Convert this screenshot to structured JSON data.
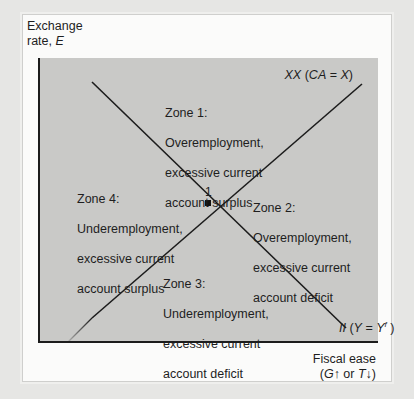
{
  "axes": {
    "y_label_line1": "Exchange",
    "y_label_line2_prefix": "rate, ",
    "y_label_var": "E",
    "x_label_line1": "Fiscal ease",
    "x_label_line2_open": "(",
    "x_label_G": "G",
    "x_label_up": "↑ or ",
    "x_label_T": "T",
    "x_label_down": "↓)"
  },
  "curves": {
    "xx": {
      "name": "XX",
      "condition_open": " (",
      "condition_var": "CA",
      "condition_eq": " = ",
      "condition_rhs": "X",
      "condition_close": ")",
      "color": "#1c1c1c"
    },
    "ii": {
      "name": "II",
      "condition_open": " (",
      "condition_var": "Y",
      "condition_eq": " =  ",
      "condition_rhs": "Y",
      "condition_sup": "f",
      "condition_close": " )",
      "color": "#1c1c1c"
    }
  },
  "equilibrium": {
    "label": "1"
  },
  "zones": [
    {
      "id": 1,
      "title": "Zone 1:",
      "line1": "Overemployment,",
      "line2": "excessive current",
      "line3": "account surplus"
    },
    {
      "id": 2,
      "title": "Zone 2:",
      "line1": "Overemployment,",
      "line2": "excessive current",
      "line3": "account deficit"
    },
    {
      "id": 3,
      "title": "Zone 3:",
      "line1": "Underemployment,",
      "line2": "excessive current",
      "line3": "account deficit"
    },
    {
      "id": 4,
      "title": "Zone 4:",
      "line1": "Underemployment,",
      "line2": "excessive current",
      "line3": "account surplus"
    }
  ],
  "colors": {
    "page_bg": "#e6e6e4",
    "card_bg": "#fbfbfa",
    "plot_bg": "#c9c9c7",
    "line": "#1c1c1c"
  }
}
